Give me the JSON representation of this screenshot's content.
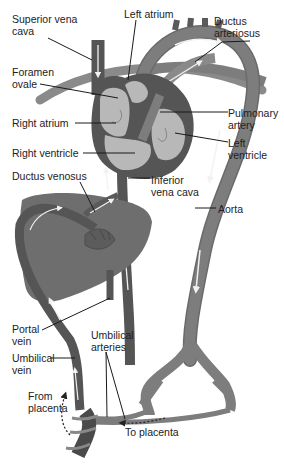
{
  "diagram": {
    "colors": {
      "background": "#ffffff",
      "vein_dark": "#5a5a5a",
      "artery_mid": "#7d7d7d",
      "heart_chamber": "#b8b8b8",
      "liver": "#6e6e6e",
      "flow_arrow": "#f2f2f2",
      "label_text": "#222222",
      "leader_line": "#1a1a1a"
    },
    "labels": [
      {
        "id": "superior-vena-cava",
        "text": "Superior vena\ncava",
        "x": 12,
        "y": 13
      },
      {
        "id": "left-atrium",
        "text": "Left atrium",
        "x": 124,
        "y": 8
      },
      {
        "id": "ductus-arteriosus",
        "text": "Ductus\narteriosus",
        "x": 214,
        "y": 15
      },
      {
        "id": "foramen-ovale",
        "text": "Foramen\novale",
        "x": 12,
        "y": 66
      },
      {
        "id": "pulmonary-artery",
        "text": "Pulmonary\nartery",
        "x": 228,
        "y": 107
      },
      {
        "id": "right-atrium",
        "text": "Right atrium",
        "x": 12,
        "y": 117
      },
      {
        "id": "left-ventricle",
        "text": "Left\nventricle",
        "x": 228,
        "y": 137
      },
      {
        "id": "right-ventricle",
        "text": "Right ventricle",
        "x": 12,
        "y": 147
      },
      {
        "id": "inferior-vena-cava",
        "text": "Inferior\nvena cava",
        "x": 151,
        "y": 174
      },
      {
        "id": "ductus-venosus",
        "text": "Ductus venosus",
        "x": 12,
        "y": 170
      },
      {
        "id": "aorta",
        "text": "Aorta",
        "x": 218,
        "y": 203
      },
      {
        "id": "portal-vein",
        "text": "Portal\nvein",
        "x": 12,
        "y": 323
      },
      {
        "id": "umbilical-arteries",
        "text": "Umbilical\narteries",
        "x": 91,
        "y": 329
      },
      {
        "id": "umbilical-vein",
        "text": "Umbilical\nvein",
        "x": 12,
        "y": 352
      },
      {
        "id": "from-placenta",
        "text": "From\nplacenta",
        "x": 28,
        "y": 390
      },
      {
        "id": "to-placenta",
        "text": "To placenta",
        "x": 125,
        "y": 426
      }
    ],
    "flow_annotations": {
      "from_placenta_arrow": "dashed-arrow-up",
      "to_placenta_arrow": "dashed-arrow-left"
    }
  }
}
